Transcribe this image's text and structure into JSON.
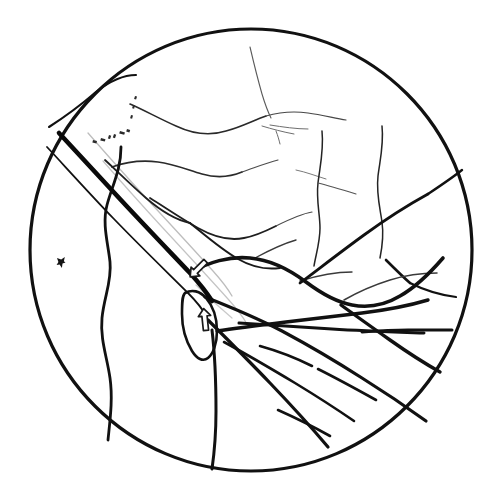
{
  "figure": {
    "kind": "hand-drawn-fundus-diagram",
    "title": "",
    "caption": "",
    "background_color": "#ffffff",
    "ink_color": "#111111",
    "faint_ink_color": "#b3b3b3",
    "arrow_outline_color": "#1a1a1a",
    "canvas": {
      "width": 504,
      "height": 492
    }
  },
  "fundus_circle": {
    "label": "fundus field border",
    "center_x": 251,
    "center_y": 250,
    "radius": 221,
    "stroke_color": "#111111",
    "stroke_width": 3.2
  },
  "annotations": {
    "arrows": [
      {
        "name": "arrow-upper",
        "label": "",
        "direction": "down-left",
        "tip_x": 188,
        "tip_y": 278,
        "rotation_deg": 225
      },
      {
        "name": "arrow-lower",
        "label": "",
        "direction": "up",
        "tip_x": 208,
        "tip_y": 307,
        "rotation_deg": 0
      }
    ],
    "marks": [
      {
        "name": "lesion-mark",
        "label": "",
        "x": 61,
        "y": 262,
        "description": "small dark pigment speck"
      }
    ],
    "stipple_groups": [
      {
        "name": "stipple-upper-left",
        "count": 9
      }
    ]
  },
  "strokes": {
    "fold_band": {
      "name": "retinal-fold-band",
      "description": "thick dark diagonal band from upper-left to centre",
      "stroke_width_primary": 4.4,
      "stroke_width_secondary": 1.6,
      "stroke_width_faint": 1.3
    },
    "vessel_weights": {
      "thick": 4.0,
      "medium": 2.4,
      "thin": 1.4,
      "hair": 1.0
    }
  },
  "paths": {
    "circle_border": "M 251 29 C 372 29 472 128 472 250 C 472 372 372 471 251 471 C 130 471 30 372 30 250 C 30 128 130 29 251 29 Z",
    "fold_thick": "M 59 133 C 72 147 96 173 120 199 C 146 227 172 254 190 273 C 200 284 207 293 212 301",
    "fold_thin_upper": "M 47 147 C 62 163 88 192 114 219 C 142 248 170 275 188 293 C 197 302 203 310 207 317",
    "fold_inner_faint": "M 88 133 C 101 148 124 174 147 199 C 172 226 196 252 213 271 C 222 281 228 289 232 296",
    "fold_inner_faint2": "M 103 161 C 116 176 139 202 162 227 C 187 254 211 280 228 299 C 237 309 243 317 247 324",
    "fold_tail_faint": "M 196 285 C 207 296 220 308 232 318",
    "disc_outline": "M 185 293 C 192 289 200 291 206 298 C 213 306 217 318 217 331 C 217 344 213 354 208 358 C 203 362 197 359 192 351 C 186 341 182 327 182 314 C 182 303 182 296 185 293 Z",
    "arc_upper_left": "M 49 127 C 63 118 82 104 96 92 C 110 81 124 75 136 75",
    "vessel_left_wavy": "M 121 147 C 121 170 112 186 107 205 C 102 224 108 243 110 262 C 112 281 104 297 102 318 C 100 339 107 357 110 378 C 113 399 110 420 108 440",
    "vessel_main_arch": "M 190 273 C 208 262 230 256 250 258 C 272 260 290 270 306 282 C 322 294 336 302 352 305 C 368 308 385 305 400 296 C 416 287 430 273 443 258",
    "vessel_main_arch2": "M 217 331 C 238 328 262 325 286 322 C 312 319 338 316 362 313 C 386 310 408 306 428 300",
    "vessel_arch_to_rim": "M 300 283 C 320 268 342 251 364 235 C 386 219 408 205 428 194",
    "vessel_rim_right": "M 428 194 C 440 186 452 178 462 170",
    "vessel_branch_a": "M 205 297 C 228 306 255 317 282 331 C 310 346 337 362 362 378 C 386 393 408 408 426 421",
    "vessel_branch_b": "M 208 320 C 226 338 248 360 270 383 C 292 406 312 428 328 447",
    "vessel_branch_c": "M 212 330 C 215 355 216 383 216 411 C 216 435 214 455 212 469",
    "vessel_branch_d": "M 224 342 C 246 354 270 368 295 383 C 318 397 338 410 354 421",
    "vessel_branch_e": "M 239 323 C 268 325 300 327 332 329 C 364 331 396 332 424 333",
    "vessel_up_1": "M 130 104 C 144 110 160 119 176 126 C 193 134 210 136 226 131 C 241 127 254 120 266 116",
    "vessel_up_1b": "M 266 116 C 280 112 294 111 308 113 C 322 115 334 118 346 120",
    "vessel_up_2": "M 112 167 C 126 162 142 160 158 162 C 174 164 188 170 202 174 C 216 178 230 177 242 172",
    "vessel_up_2b": "M 242 172 C 254 168 266 163 278 160",
    "vessel_up_3": "M 105 160 C 118 172 132 186 146 198 C 161 211 176 220 190 223",
    "vessel_up_4": "M 150 198 C 166 208 182 219 198 228 C 214 237 230 241 244 238 C 256 236 266 231 276 226",
    "vessel_up_4b": "M 276 226 C 288 220 300 214 312 212",
    "vessel_up_5": "M 190 223 C 206 236 222 250 238 259 C 252 267 266 270 280 268",
    "vessel_up_6": "M 250 47 C 254 64 258 80 262 94 C 265 104 268 112 271 118",
    "vessel_up_6b": "M 276 131 C 278 136 279 140 280 144",
    "vessel_up_7": "M 262 126 C 272 129 283 132 294 134",
    "vessel_up_8": "M 270 125 C 283 127 296 129 308 129",
    "vessel_up_9": "M 296 170 C 306 172 316 176 326 179",
    "vessel_right_1": "M 322 131 C 324 150 320 166 318 183 C 316 200 320 214 320 228 C 320 242 316 254 314 266",
    "vessel_right_2": "M 382 126 C 384 144 380 160 378 176 C 376 193 380 208 382 222 C 384 236 382 248 380 258",
    "vessel_right_3": "M 386 260 C 394 268 402 276 410 283",
    "vessel_right_4": "M 410 283 C 424 290 440 295 456 297",
    "vessel_right_5": "M 318 183 C 330 186 343 190 356 194",
    "vessel_right_6": "M 344 300 C 358 292 374 285 390 280 C 406 275 422 273 437 273",
    "vessel_right_7": "M 452 330 C 440 330 424 330 408 330 C 392 330 376 331 362 332",
    "vessel_right_8": "M 341 305 C 356 316 373 328 390 340 C 407 352 424 363 440 372",
    "vessel_right_9": "M 300 281 C 316 276 334 272 352 272",
    "vessel_right_10": "M 255 258 C 268 251 282 244 296 240",
    "vessel_lower_right_a": "M 260 346 C 278 351 296 358 312 366",
    "vessel_lower_right_b": "M 318 369 C 338 379 358 390 376 400",
    "vessel_lower_right_c": "M 278 410 C 296 418 314 427 330 436"
  }
}
